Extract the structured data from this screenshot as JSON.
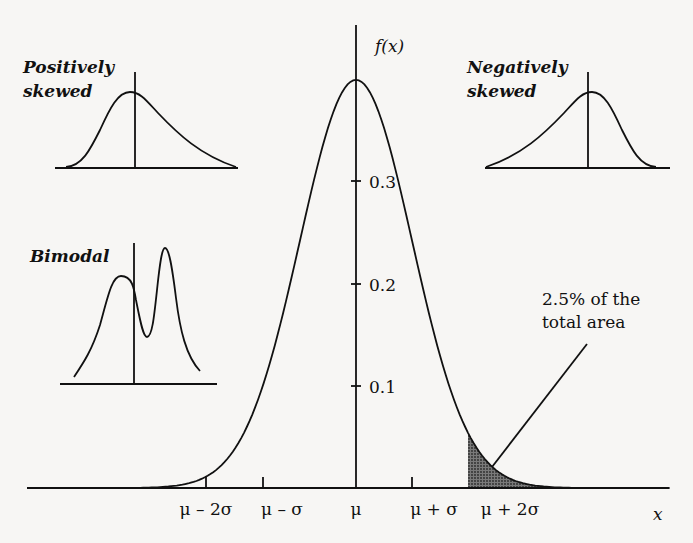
{
  "chart_data": {
    "type": "line",
    "title": "",
    "xlabel": "x",
    "ylabel": "f(x)",
    "ylim": [
      0,
      0.4
    ],
    "y_ticks": [
      "0.1",
      "0.2",
      "0.3"
    ],
    "x_ticks": [
      "μ – 2σ",
      "μ – σ",
      "μ",
      "μ + σ",
      "μ + 2σ"
    ],
    "series": [
      {
        "name": "Normal distribution f(x)",
        "x_sigma": [
          -3.5,
          -3,
          -2.5,
          -2,
          -1.5,
          -1,
          -0.5,
          0,
          0.5,
          1,
          1.5,
          2,
          2.5,
          3,
          3.5
        ],
        "values": [
          0.001,
          0.004,
          0.018,
          0.054,
          0.13,
          0.242,
          0.352,
          0.399,
          0.352,
          0.242,
          0.13,
          0.054,
          0.018,
          0.004,
          0.001
        ]
      }
    ],
    "shaded_region": {
      "from": "μ + 2σ",
      "to": "+∞",
      "label": "2.5% of the total area"
    },
    "annotations": [
      "2.5% of the total area"
    ],
    "insets": [
      {
        "name": "Positively skewed",
        "shape": "right-tailed"
      },
      {
        "name": "Negatively skewed",
        "shape": "left-tailed"
      },
      {
        "name": "Bimodal",
        "shape": "two peaks"
      }
    ],
    "grid": false,
    "legend": "none"
  },
  "labels": {
    "y_axis": "f(x)",
    "x_axis": "x",
    "y_tick_03": "0.3",
    "y_tick_02": "0.2",
    "y_tick_01": "0.1",
    "x_tick_m2s": "μ – 2σ",
    "x_tick_m1s": "μ – σ",
    "x_tick_mu": "μ",
    "x_tick_p1s": "μ + σ",
    "x_tick_p2s": "μ + 2σ",
    "annotation_line1": "2.5% of the",
    "annotation_line2": "total area",
    "inset_pos_line1": "Positively",
    "inset_pos_line2": "skewed",
    "inset_neg_line1": "Negatively",
    "inset_neg_line2": "skewed",
    "inset_bimodal": "Bimodal"
  },
  "colors": {
    "ink": "#111111",
    "background": "#f7f6f4",
    "shade": "#555555"
  }
}
